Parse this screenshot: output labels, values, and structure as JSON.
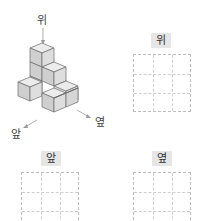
{
  "figure": {
    "directions": {
      "top": "위",
      "front": "앞",
      "side": "옆"
    },
    "cube_structure": "isometric stack of unit cubes viewed from 위 (top), 앞 (front), 옆 (side)"
  },
  "views": [
    {
      "label": "위",
      "grid": {
        "rows": 3,
        "cols": 3
      }
    },
    {
      "label": "앞",
      "grid": {
        "rows": 3,
        "cols": 3
      }
    },
    {
      "label": "옆",
      "grid": {
        "rows": 3,
        "cols": 3
      }
    }
  ],
  "colors": {
    "cube_face_light": "#e8e8e8",
    "cube_face_mid": "#d0d0d0",
    "cube_face_dark": "#bdbdbd",
    "cube_edge": "#6a6a6a",
    "label_bg": "#e6e6e6",
    "grid_line": "#c8c8c8"
  }
}
